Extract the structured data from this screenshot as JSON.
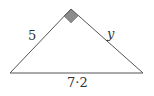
{
  "diagram": {
    "type": "right-triangle",
    "vertices": {
      "left": [
        10,
        73
      ],
      "apex": [
        71,
        9
      ],
      "right": [
        143,
        73
      ]
    },
    "right_angle_at": "apex",
    "right_angle_marker_color": "#8c8c8c",
    "stroke_color": "#555555",
    "labels": {
      "left_side": "5",
      "right_side": "y",
      "base": "7·2"
    }
  }
}
